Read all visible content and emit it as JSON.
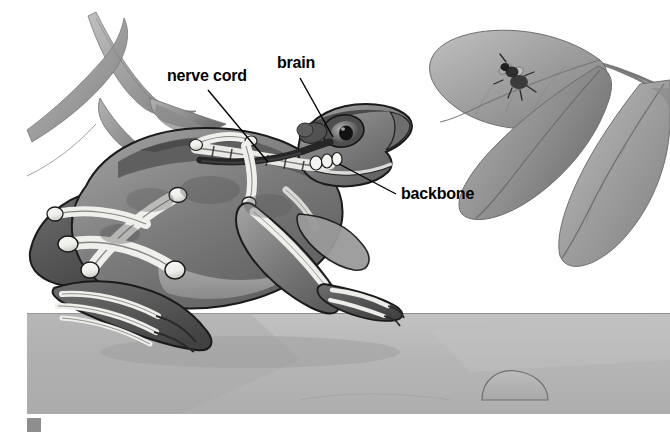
{
  "figure": {
    "style": "grayscale-airbrush-illustration",
    "canvas": {
      "width": 670,
      "height": 433
    },
    "artwork_bounds": {
      "x": 27,
      "y": 0,
      "width": 643,
      "height": 414
    },
    "margin_color": "#ffffff"
  },
  "labels": {
    "nerve_cord": "nerve cord",
    "brain": "brain",
    "backbone": "backbone"
  },
  "leaders": {
    "nerve_cord": {
      "from": [
        208,
        90
      ],
      "to": [
        268,
        162
      ]
    },
    "brain": {
      "from": [
        300,
        78
      ],
      "to": [
        333,
        137
      ]
    },
    "backbone": {
      "from": [
        396,
        194
      ],
      "to": [
        339,
        164
      ]
    }
  },
  "scene": {
    "background_color": "#ffffff",
    "ground_color": "#b4b4b4",
    "ground_shadow_color": "#a3a3a3",
    "horizon_y": 313,
    "ground_bottom_y": 414,
    "stone": {
      "cx": 515,
      "cy": 392,
      "rx": 33,
      "ry": 20
    },
    "foliage_color": "#9a9a9a",
    "foliage_dark": "#767676",
    "foliage_light": "#bcbcbc",
    "leaves_left_count": 3,
    "leaves_right_count": 4,
    "insect": "housefly",
    "insect_position": [
      520,
      75
    ],
    "insect_color": "#3a3a3a"
  },
  "frog": {
    "body_color": "#8f8f8f",
    "body_dark": "#6b6b6b",
    "body_darkest": "#4a4a4a",
    "belly_color": "#a9a9a9",
    "bone_color": "#f2f2ef",
    "bone_shade": "#d6d6d2",
    "outline_color": "#1a1a1a",
    "eye_pupil_color": "#141414",
    "nerve_cord_color": "#272727",
    "anatomy_parts": [
      "brain",
      "nerve cord",
      "backbone",
      "skull",
      "pelvis",
      "femur",
      "tibiofibula",
      "humerus",
      "radioulna",
      "phalanges"
    ]
  },
  "corner_marker": {
    "color": "#8e8e8e",
    "size": 14
  }
}
